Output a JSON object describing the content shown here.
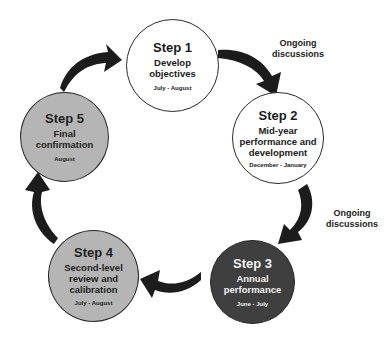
{
  "diagram": {
    "type": "cycle",
    "colors": {
      "arrow": "#1c1c1c",
      "white_fill": "#ffffff",
      "grey_fill": "#b5b5b5",
      "dark_fill": "#3f3f3f",
      "outline": "#2a2a2a"
    },
    "steps": [
      {
        "number": "Step 1",
        "name_lines": [
          "Develop",
          "objectives"
        ],
        "period": "July -  August"
      },
      {
        "number": "Step 2",
        "name_lines": [
          "Mid-year",
          "performance and",
          "development"
        ],
        "period": "December -  January"
      },
      {
        "number": "Step 3",
        "name_lines": [
          "Annual",
          "performance"
        ],
        "period": "June -  July"
      },
      {
        "number": "Step 4",
        "name_lines": [
          "Second-level",
          "review and",
          "calibration"
        ],
        "period": "July -  August"
      },
      {
        "number": "Step 5",
        "name_lines": [
          "Final",
          "confirmation"
        ],
        "period": "August"
      }
    ],
    "annotations": [
      {
        "lines": [
          "Ongoing",
          "discussions"
        ],
        "between": "Step 1 -> Step 2"
      },
      {
        "lines": [
          "Ongoing",
          "discussions"
        ],
        "between": "Step 2 -> Step 3"
      }
    ],
    "arrows": [
      {
        "from": "Step 1",
        "to": "Step 2",
        "icon": "curved-arrow-icon"
      },
      {
        "from": "Step 2",
        "to": "Step 3",
        "icon": "curved-arrow-icon"
      },
      {
        "from": "Step 3",
        "to": "Step 4",
        "icon": "curved-arrow-icon"
      },
      {
        "from": "Step 4",
        "to": "Step 5",
        "icon": "curved-arrow-icon"
      },
      {
        "from": "Step 5",
        "to": "Step 1",
        "icon": "curved-arrow-icon"
      }
    ]
  }
}
